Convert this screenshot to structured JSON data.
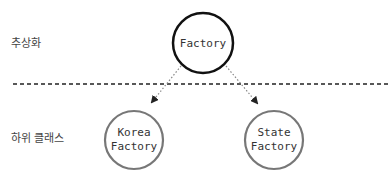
{
  "levels": {
    "abstract_label": "추상화",
    "subclass_label": "하위 클래스"
  },
  "nodes": {
    "top": {
      "lines": [
        "Factory"
      ],
      "stroke": "#111111"
    },
    "left": {
      "lines": [
        "Korea",
        "Factory"
      ],
      "stroke": "#777777"
    },
    "right": {
      "lines": [
        "State",
        "Factory"
      ],
      "stroke": "#777777"
    }
  },
  "colors": {
    "divider": "#222222",
    "arrow": "#888888",
    "arrowhead": "#222222"
  }
}
